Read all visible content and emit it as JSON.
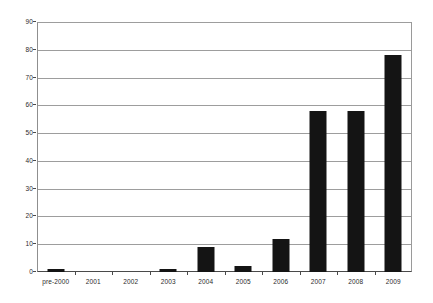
{
  "chart_data": {
    "type": "bar",
    "title": "",
    "subtitle": "",
    "xlabel": "",
    "ylabel": "",
    "categories": [
      "pre-2000",
      "2001",
      "2002",
      "2003",
      "2004",
      "2005",
      "2006",
      "2007",
      "2008",
      "2009"
    ],
    "values": [
      1,
      0,
      0,
      1,
      9,
      2,
      12,
      58,
      58,
      78
    ],
    "series": [
      {
        "name": "",
        "values": [
          1,
          0,
          0,
          1,
          9,
          2,
          12,
          58,
          58,
          78
        ]
      }
    ],
    "ylim": [
      0,
      90
    ],
    "ytick_step": 10,
    "yticks": [
      0,
      10,
      20,
      30,
      40,
      50,
      60,
      70,
      80,
      90
    ],
    "ytick_labels": [
      "0",
      "10",
      "20",
      "30",
      "40",
      "50",
      "60",
      "70",
      "80",
      "90"
    ],
    "grid": true,
    "grid_axis": "y",
    "legend": false,
    "legend_position": "none",
    "bar_color": "#141414",
    "gridline_color": "#9d9d9d",
    "axis_color": "#4a4a4a",
    "background_color": "#ffffff",
    "text_color": "#2b2b2b"
  }
}
